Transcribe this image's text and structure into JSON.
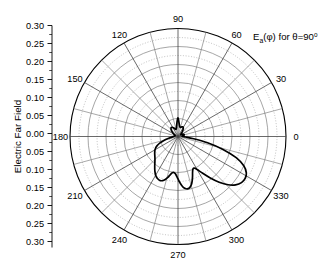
{
  "figure": {
    "background_color": "#ffffff",
    "ink_color": "#000000",
    "grid_color": "#7a7a7a",
    "minor_grid_color": "#9a9a9a",
    "curve_color": "#000000"
  },
  "axis_titles": {
    "radial": "Electric Far Field"
  },
  "annotation": {
    "base": "E",
    "subscript": "a",
    "argument": "(φ)",
    "middle": " for ",
    "theta": "θ=90",
    "degree": "o",
    "full_text": "Eₐ(φ) for θ=90°"
  },
  "chart_data": {
    "type": "line",
    "projection": "polar",
    "title": "",
    "subtitle": "",
    "xlabel": "",
    "ylabel": "Electric Far Field",
    "legend": [],
    "grid": true,
    "angle_unit": "degrees",
    "angular_direction": "counterclockwise",
    "angular_zero_at": "east",
    "angular_ticks": [
      0,
      30,
      60,
      90,
      120,
      150,
      180,
      210,
      240,
      270,
      300,
      330
    ],
    "angular_tick_labels": [
      "0",
      "30",
      "60",
      "90",
      "120",
      "150",
      "180",
      "210",
      "240",
      "270",
      "300",
      "330"
    ],
    "rlim": [
      0,
      0.3
    ],
    "r_major_ticks": [
      0.0,
      0.05,
      0.1,
      0.15,
      0.2,
      0.25,
      0.3
    ],
    "r_major_tick_labels": [
      "0.00",
      "0.05",
      "0.10",
      "0.15",
      "0.20",
      "0.25",
      "0.30"
    ],
    "r_minor_step": 0.025,
    "r_axis_labels_mirrored": true,
    "r_axis_labels_top_to_bottom": [
      "0.30",
      "0.25",
      "0.20",
      "0.15",
      "0.10",
      "0.05",
      "0.00",
      "0.05",
      "0.10",
      "0.15",
      "0.20",
      "0.25",
      "0.30"
    ],
    "series": [
      {
        "name": "E_a(phi) at theta=90 deg",
        "closed": true,
        "theta": [
          0,
          4,
          8,
          12,
          16,
          20,
          24,
          28,
          32,
          36,
          40,
          44,
          48,
          52,
          56,
          60,
          64,
          68,
          72,
          76,
          80,
          84,
          86,
          88,
          90,
          92,
          94,
          96,
          100,
          104,
          108,
          112,
          116,
          120,
          124,
          128,
          132,
          136,
          140,
          144,
          148,
          152,
          156,
          160,
          164,
          168,
          172,
          176,
          180,
          184,
          188,
          192,
          196,
          200,
          204,
          208,
          212,
          216,
          220,
          224,
          228,
          232,
          236,
          240,
          244,
          248,
          252,
          256,
          258,
          260,
          262,
          264,
          266,
          268,
          270,
          272,
          274,
          276,
          278,
          280,
          282,
          284,
          286,
          288,
          290,
          292,
          294,
          296,
          298,
          300,
          304,
          308,
          312,
          316,
          320,
          324,
          328,
          332,
          336,
          340,
          344,
          348,
          352,
          356
        ],
        "r": [
          0.012,
          0.013,
          0.015,
          0.017,
          0.018,
          0.017,
          0.014,
          0.011,
          0.009,
          0.009,
          0.011,
          0.014,
          0.018,
          0.022,
          0.026,
          0.029,
          0.03,
          0.029,
          0.027,
          0.026,
          0.028,
          0.034,
          0.039,
          0.046,
          0.052,
          0.047,
          0.04,
          0.033,
          0.025,
          0.021,
          0.021,
          0.023,
          0.026,
          0.029,
          0.031,
          0.031,
          0.029,
          0.026,
          0.022,
          0.018,
          0.014,
          0.011,
          0.009,
          0.008,
          0.008,
          0.009,
          0.01,
          0.011,
          0.012,
          0.015,
          0.021,
          0.03,
          0.042,
          0.054,
          0.064,
          0.071,
          0.076,
          0.08,
          0.084,
          0.089,
          0.096,
          0.105,
          0.115,
          0.124,
          0.13,
          0.132,
          0.128,
          0.117,
          0.11,
          0.104,
          0.101,
          0.101,
          0.104,
          0.11,
          0.118,
          0.127,
          0.135,
          0.142,
          0.146,
          0.148,
          0.147,
          0.143,
          0.137,
          0.128,
          0.118,
          0.108,
          0.101,
          0.098,
          0.1,
          0.106,
          0.123,
          0.146,
          0.171,
          0.193,
          0.209,
          0.218,
          0.22,
          0.215,
          0.2,
          0.172,
          0.13,
          0.084,
          0.044,
          0.021
        ]
      }
    ],
    "features": {
      "main_lobe_peak_angle_deg": 328,
      "main_lobe_peak_value": 0.22,
      "secondary_lobe_peak_angle_deg": 278,
      "secondary_lobe_peak_value": 0.148,
      "third_lobe_peak_angle_deg": 248,
      "third_lobe_peak_value": 0.132,
      "narrow_spike_angle_deg": 90,
      "narrow_spike_value": 0.052,
      "null_angle_deg": 160,
      "null_value": 0.008
    }
  }
}
